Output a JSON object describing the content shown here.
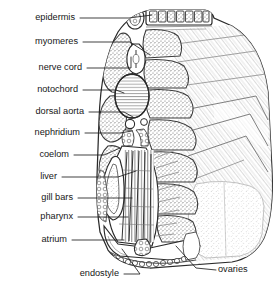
{
  "figure": {
    "organism": "Amphioxus (lancelet)",
    "view": "transverse section through pharyngeal region",
    "style": "black-and-white stippled line engraving",
    "background_color": "#ffffff",
    "ink_color": "#1a1a1a",
    "fill_tone": "#9a9a9a"
  },
  "labels": [
    {
      "id": "epidermis",
      "text": "epidermis",
      "text_x": 75,
      "text_y": 18,
      "leader": [
        [
          80,
          18
        ],
        [
          129,
          18
        ],
        [
          152,
          15
        ]
      ]
    },
    {
      "id": "myomeres",
      "text": "myomeres",
      "text_x": 78,
      "text_y": 42,
      "leader": [
        [
          83,
          42
        ],
        [
          130,
          42
        ],
        [
          150,
          55
        ]
      ]
    },
    {
      "id": "nerve-cord",
      "text": "nerve cord",
      "text_x": 82,
      "text_y": 68,
      "leader": [
        [
          87,
          68
        ],
        [
          131,
          68
        ],
        [
          131,
          57
        ]
      ]
    },
    {
      "id": "notochord",
      "text": "notochord",
      "text_x": 78,
      "text_y": 90,
      "leader": [
        [
          83,
          90
        ],
        [
          116,
          90
        ],
        [
          124,
          93
        ]
      ]
    },
    {
      "id": "dorsal-aorta",
      "text": "dorsal aorta",
      "text_x": 84,
      "text_y": 112,
      "leader": [
        [
          89,
          112
        ],
        [
          124,
          112
        ],
        [
          133,
          117
        ]
      ]
    },
    {
      "id": "nephridium",
      "text": "nephridium",
      "text_x": 80,
      "text_y": 133,
      "leader": [
        [
          85,
          133
        ],
        [
          120,
          133
        ],
        [
          132,
          131
        ]
      ]
    },
    {
      "id": "coelom",
      "text": "coelom",
      "text_x": 69,
      "text_y": 155,
      "leader": [
        [
          74,
          155
        ],
        [
          104,
          155
        ],
        [
          120,
          148
        ]
      ]
    },
    {
      "id": "liver",
      "text": "liver",
      "text_x": 57,
      "text_y": 177,
      "leader": [
        [
          62,
          177
        ],
        [
          118,
          177
        ],
        [
          136,
          171
        ]
      ]
    },
    {
      "id": "gill-bars",
      "text": "gill bars",
      "text_x": 73,
      "text_y": 198,
      "leader": [
        [
          78,
          198
        ],
        [
          132,
          198
        ]
      ]
    },
    {
      "id": "pharynx",
      "text": "pharynx",
      "text_x": 73,
      "text_y": 217,
      "leader": [
        [
          78,
          217
        ],
        [
          128,
          217
        ]
      ]
    },
    {
      "id": "atrium",
      "text": "atrium",
      "text_x": 67,
      "text_y": 240,
      "leader": [
        [
          72,
          240
        ],
        [
          124,
          240
        ]
      ]
    },
    {
      "id": "endostyle",
      "text": "endostyle",
      "text_x": 119,
      "text_y": 274,
      "leader": [
        [
          124,
          274
        ],
        [
          140,
          274
        ],
        [
          122,
          249
        ]
      ]
    },
    {
      "id": "ovaries",
      "text": "ovaries",
      "text_x": 218,
      "text_y": 270,
      "leader": [
        [
          216,
          270
        ],
        [
          196,
          268
        ],
        [
          176,
          246
        ]
      ],
      "anchor": "start"
    }
  ],
  "structures": [
    {
      "id": "dorsal-fin-box",
      "name": "dorsal fin ray box"
    },
    {
      "id": "nerve-cord-body",
      "name": "nerve cord"
    },
    {
      "id": "notochord-body",
      "name": "notochord"
    },
    {
      "id": "myomere-left",
      "name": "left myomere block"
    },
    {
      "id": "myomere-stack",
      "name": "right myomere segments"
    },
    {
      "id": "pharynx-cavity",
      "name": "pharynx with gill bars"
    },
    {
      "id": "liver-diverticulum",
      "name": "hepatic caecum"
    },
    {
      "id": "atrium-cavity",
      "name": "atrium"
    },
    {
      "id": "endostyle-body",
      "name": "endostyle"
    },
    {
      "id": "ovary-mass",
      "name": "ovaries"
    },
    {
      "id": "body-outline",
      "name": "body wall outline"
    }
  ]
}
